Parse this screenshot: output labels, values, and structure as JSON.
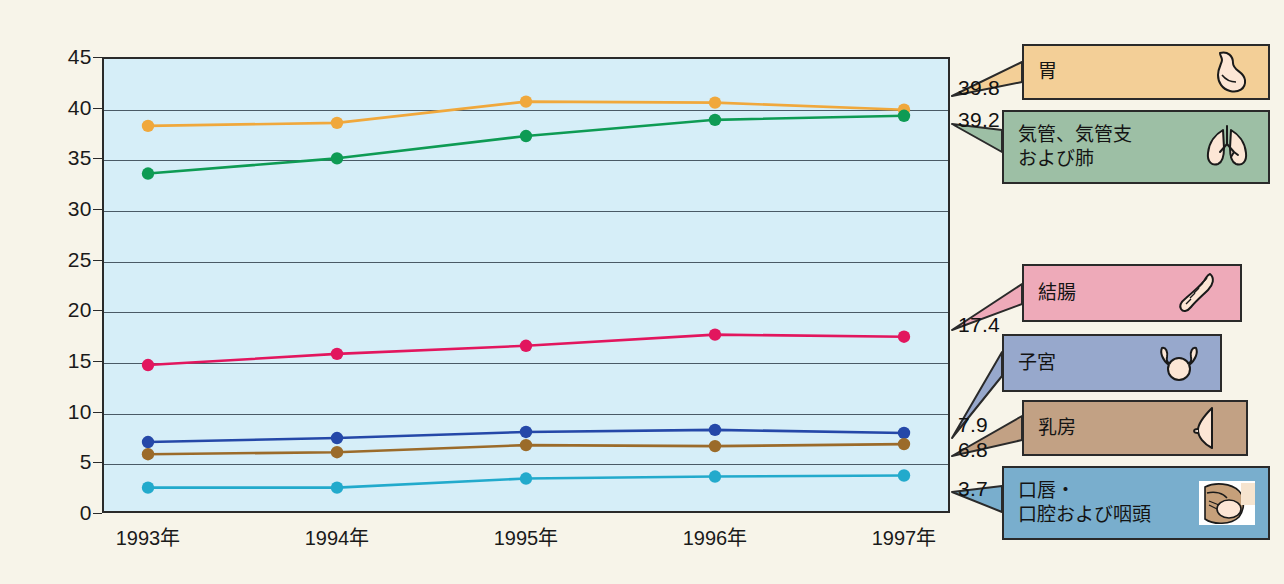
{
  "figure": {
    "background_color": "#f7f4e9",
    "plot_background_color": "#d6eef8",
    "plot_border_color": "#2a2a2a"
  },
  "chart_data": {
    "type": "line",
    "title": "",
    "subtitle": "",
    "xlabel": "",
    "ylabel": "",
    "x": [
      "1993年",
      "1994年",
      "1995年",
      "1996年",
      "1997年"
    ],
    "categories": [
      "1993年",
      "1994年",
      "1995年",
      "1996年",
      "1997年"
    ],
    "ylim": [
      0,
      45
    ],
    "yticks": [
      0,
      5,
      10,
      15,
      20,
      25,
      30,
      35,
      40,
      45
    ],
    "ytick_labels": [
      "0",
      "5",
      "10",
      "15",
      "20",
      "25",
      "30",
      "35",
      "40",
      "45"
    ],
    "grid": true,
    "grid_axis": "y",
    "legend_position": "right",
    "series": [
      {
        "name": "胃",
        "color": "#f0a83c",
        "marker_color": "#f0a83c",
        "values": [
          38.2,
          38.5,
          40.6,
          40.5,
          39.8
        ],
        "end_label": "39.8"
      },
      {
        "name": "気管、気管支\nおよび肺",
        "color": "#0e9b54",
        "marker_color": "#0e9b54",
        "values": [
          33.5,
          35.0,
          37.2,
          38.8,
          39.2
        ],
        "end_label": "39.2"
      },
      {
        "name": "結腸",
        "color": "#e2165e",
        "marker_color": "#e2165e",
        "values": [
          14.6,
          15.7,
          16.5,
          17.6,
          17.4
        ],
        "end_label": "17.4"
      },
      {
        "name": "子宮",
        "color": "#2548a8",
        "marker_color": "#2548a8",
        "values": [
          7.0,
          7.4,
          8.0,
          8.2,
          7.9
        ],
        "end_label": "7.9"
      },
      {
        "name": "乳房",
        "color": "#9b6b2a",
        "marker_color": "#9b6b2a",
        "values": [
          5.8,
          6.0,
          6.7,
          6.6,
          6.8
        ],
        "end_label": "6.8"
      },
      {
        "name": "口唇・\n口腔および咽頭",
        "color": "#22aacc",
        "marker_color": "#22aacc",
        "values": [
          2.5,
          2.5,
          3.4,
          3.6,
          3.7
        ],
        "end_label": "3.7"
      }
    ]
  },
  "legend": {
    "items": [
      {
        "label": "胃",
        "fill": "#f3cf97",
        "icon": "stomach-icon",
        "series_index": 0
      },
      {
        "label": "気管、気管支\nおよび肺",
        "fill": "#9dbfa5",
        "icon": "lungs-icon",
        "series_index": 1
      },
      {
        "label": "結腸",
        "fill": "#eeaab9",
        "icon": "colon-icon",
        "series_index": 2
      },
      {
        "label": "子宮",
        "fill": "#97a8cc",
        "icon": "uterus-icon",
        "series_index": 3
      },
      {
        "label": "乳房",
        "fill": "#c2a184",
        "icon": "breast-icon",
        "series_index": 4
      },
      {
        "label": "口唇・\n口腔および咽頭",
        "fill": "#79aecd",
        "icon": "oral-cavity-icon",
        "series_index": 5
      }
    ]
  }
}
